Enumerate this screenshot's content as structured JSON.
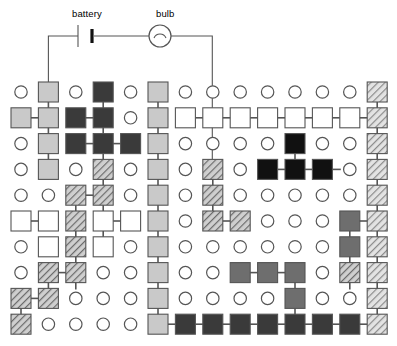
{
  "circuit": {
    "battery_label": "battery",
    "bulb_label": "bulb",
    "wire_color": "#555555",
    "battery_symbol": "battery-cell-icon",
    "bulb_symbol": "lamp-icon"
  },
  "grid": {
    "cols": 14,
    "rows": 10,
    "x0": 21,
    "y0": 92,
    "dx": 27.4,
    "dy": 25.8,
    "square": 20,
    "circle_r": 6.2
  },
  "palette": {
    "empty_stroke": "#555555",
    "link": "#555555",
    "light_gray": "#c9c9c9",
    "mid_gray": "#8f8f8f",
    "dark_gray": "#6e6e6e",
    "very_dark": "#3a3a3a",
    "black": "#111111",
    "white": "#ffffff",
    "hatch_light": "#b9b9b9",
    "hatch_mid": "#8f8f8f",
    "hatch_dark": "#6e6e6e",
    "outline": "#555555"
  },
  "chart_data": {
    "type": "heatmap",
    "title": "",
    "xlabel": "",
    "ylabel": "",
    "legend": [
      "battery",
      "bulb"
    ],
    "cells": [
      [
        "o",
        "lightgray",
        "o",
        "verydark",
        "o",
        "lightgray",
        "o",
        "o",
        "o",
        "o",
        "o",
        "o",
        "o",
        "hatchlight"
      ],
      [
        "lightgray",
        "lightgray",
        "verydark",
        "verydark",
        "o",
        "lightgray",
        "white",
        "white",
        "white",
        "white",
        "white",
        "white",
        "white",
        "hatchlight"
      ],
      [
        "o",
        "lightgray",
        "verydark",
        "verydark",
        "verydark",
        "lightgray",
        "o",
        "o",
        "o",
        "o",
        "black",
        "o",
        "o",
        "hatchlight"
      ],
      [
        "o",
        "lightgray",
        "o",
        "hatchmid",
        "o",
        "lightgray",
        "o",
        "hatchmid",
        "o",
        "black",
        "black",
        "black",
        "o",
        "hatchlight"
      ],
      [
        "o",
        "o",
        "hatchmid",
        "hatchmid",
        "o",
        "lightgray",
        "o",
        "hatchmid",
        "o",
        "o",
        "o",
        "o",
        "o",
        "hatchlight"
      ],
      [
        "white",
        "white",
        "hatchmid",
        "white",
        "white",
        "lightgray",
        "o",
        "hatchmid",
        "hatchmid",
        "o",
        "o",
        "o",
        "darkgray",
        "hatchlight"
      ],
      [
        "o",
        "white",
        "hatchmid",
        "white",
        "o",
        "lightgray",
        "o",
        "o",
        "o",
        "o",
        "o",
        "o",
        "darkgray",
        "hatchlight"
      ],
      [
        "o",
        "hatchmid",
        "hatchmid",
        "o",
        "o",
        "lightgray",
        "o",
        "o",
        "darkgray",
        "darkgray",
        "darkgray",
        "o",
        "hatchmid",
        "hatchlight"
      ],
      [
        "hatchmid",
        "hatchmid",
        "o",
        "o",
        "o",
        "lightgray",
        "o",
        "o",
        "o",
        "o",
        "darkgray",
        "o",
        "o",
        "hatchlight"
      ],
      [
        "hatchmid",
        "o",
        "o",
        "o",
        "o",
        "lightgray",
        "verydark",
        "verydark",
        "verydark",
        "verydark",
        "verydark",
        "verydark",
        "verydark",
        "hatchlight"
      ]
    ],
    "h_bonds": [
      [
        1,
        0
      ],
      [
        1,
        2
      ],
      [
        2,
        2
      ],
      [
        2,
        3
      ],
      [
        4,
        2
      ],
      [
        5,
        0
      ],
      [
        5,
        3
      ],
      [
        7,
        1
      ],
      [
        8,
        0
      ],
      [
        1,
        6
      ],
      [
        1,
        7
      ],
      [
        1,
        8
      ],
      [
        1,
        9
      ],
      [
        1,
        10
      ],
      [
        1,
        11
      ],
      [
        1,
        12
      ],
      [
        3,
        9
      ],
      [
        3,
        10
      ],
      [
        3,
        11
      ],
      [
        5,
        7
      ],
      [
        5,
        12
      ],
      [
        7,
        8
      ],
      [
        7,
        9
      ],
      [
        9,
        5
      ],
      [
        9,
        6
      ],
      [
        9,
        7
      ],
      [
        9,
        8
      ],
      [
        9,
        9
      ],
      [
        9,
        10
      ],
      [
        9,
        11
      ],
      [
        9,
        12
      ]
    ],
    "v_bonds": [
      [
        0,
        1
      ],
      [
        1,
        1
      ],
      [
        2,
        1
      ],
      [
        0,
        3
      ],
      [
        1,
        3
      ],
      [
        2,
        3
      ],
      [
        3,
        3
      ],
      [
        4,
        3
      ],
      [
        4,
        2
      ],
      [
        5,
        2
      ],
      [
        6,
        2
      ],
      [
        7,
        2
      ],
      [
        5,
        3
      ],
      [
        7,
        1
      ],
      [
        8,
        0
      ],
      [
        0,
        5
      ],
      [
        1,
        5
      ],
      [
        2,
        5
      ],
      [
        3,
        5
      ],
      [
        4,
        5
      ],
      [
        5,
        5
      ],
      [
        6,
        5
      ],
      [
        7,
        5
      ],
      [
        8,
        5
      ],
      [
        3,
        7
      ],
      [
        4,
        7
      ],
      [
        2,
        10
      ],
      [
        5,
        12
      ],
      [
        6,
        12
      ],
      [
        7,
        12
      ],
      [
        7,
        10
      ],
      [
        8,
        10
      ],
      [
        0,
        13
      ],
      [
        1,
        13
      ],
      [
        2,
        13
      ],
      [
        3,
        13
      ],
      [
        4,
        13
      ],
      [
        5,
        13
      ],
      [
        6,
        13
      ],
      [
        7,
        13
      ],
      [
        8,
        13
      ]
    ]
  }
}
